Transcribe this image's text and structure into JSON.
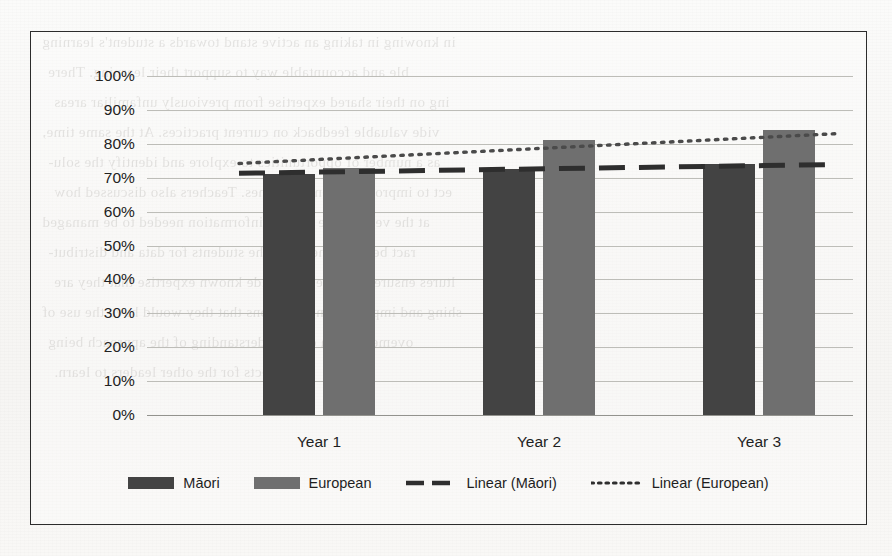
{
  "chart_data": {
    "type": "bar",
    "title": "",
    "subtitle": "",
    "xlabel": "",
    "ylabel": "",
    "categories": [
      "Year 1",
      "Year 2",
      "Year 3"
    ],
    "series": [
      {
        "name": "Māori",
        "values": [
          71,
          72.5,
          74
        ],
        "color": "#434343"
      },
      {
        "name": "European",
        "values": [
          73,
          81,
          84
        ],
        "color": "#6f6f6f"
      }
    ],
    "trendlines": [
      {
        "name": "Linear (Māori)",
        "style": "dashed",
        "color": "#2e2e2e",
        "from": 71.3,
        "to": 73.9
      },
      {
        "name": "Linear (European)",
        "style": "dotted",
        "color": "#4a4a4a",
        "from": 74.2,
        "to": 83.0
      }
    ],
    "ylim": [
      0,
      100
    ],
    "ytick_values": [
      100,
      90,
      80,
      70,
      60,
      50,
      40,
      30,
      20,
      10,
      0
    ],
    "ytick_labels": [
      "100%",
      "90%",
      "80%",
      "70%",
      "60%",
      "50%",
      "40%",
      "30%",
      "20%",
      "10%",
      "0%"
    ],
    "grid": true,
    "legend_position": "bottom",
    "legend_entries": [
      {
        "label": "Māori",
        "marker": "swatch-dark"
      },
      {
        "label": "European",
        "marker": "swatch-gray"
      },
      {
        "label": "Linear (Māori)",
        "marker": "dashed-line"
      },
      {
        "label": "Linear (European)",
        "marker": "dotted-line"
      }
    ]
  },
  "page": {
    "bleed_lines": [
      "in knowing in taking an active stand towards a student's learning",
      "ble and accountable way to support their learning. There",
      "ing on their shared expertise from previously unfamiliar areas",
      "vide valuable feedback on current practices. At the same time,",
      "as a number of opportunities to explore and identify the solu-",
      "ect to improve student outcomes. Teachers also discussed how",
      "at the very nature of such information needed to be managed",
      "ract between them and the students for data and distribut-",
      "ltures ensure it is safe to provide known expertise that they are",
      "shing and implementing solutions that they would have the use of",
      "ovement and a clear understanding of the approach being",
      "fects for the other leaders to learn."
    ]
  }
}
